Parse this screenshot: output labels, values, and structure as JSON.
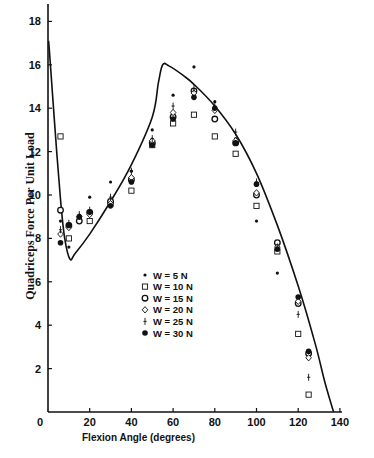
{
  "chart_data": {
    "type": "scatter",
    "title": "",
    "xlabel": "Flexion Angle (degrees)",
    "ylabel": "Quadriceps Force Per Unit Load",
    "xlim": [
      0,
      140
    ],
    "ylim": [
      0,
      18.8
    ],
    "xticks": [
      0,
      20,
      40,
      60,
      80,
      100,
      120,
      140
    ],
    "yticks": [
      0,
      2,
      4,
      6,
      8,
      10,
      12,
      14,
      16,
      18
    ],
    "grid": false,
    "legend_position": "center-left inside",
    "curve": {
      "name": "theoretical",
      "points": [
        [
          0.3,
          17.1
        ],
        [
          1,
          16.2
        ],
        [
          3,
          13.5
        ],
        [
          6,
          9.8
        ],
        [
          8,
          8.0
        ],
        [
          10.5,
          7.05
        ],
        [
          13,
          7.3
        ],
        [
          20,
          8.2
        ],
        [
          30,
          9.7
        ],
        [
          40,
          11.4
        ],
        [
          50,
          13.6
        ],
        [
          53,
          15.2
        ],
        [
          55,
          16.0
        ],
        [
          58,
          15.95
        ],
        [
          65,
          15.5
        ],
        [
          70,
          15.1
        ],
        [
          80,
          14.1
        ],
        [
          90,
          12.8
        ],
        [
          100,
          11.0
        ],
        [
          110,
          8.6
        ],
        [
          120,
          5.8
        ],
        [
          128,
          3.2
        ],
        [
          133,
          1.3
        ],
        [
          137,
          0
        ]
      ]
    },
    "series": [
      {
        "name": "W = 5 N",
        "marker": "small-dot",
        "points": [
          [
            6,
            8.8
          ],
          [
            10,
            7.6
          ],
          [
            20,
            9.9
          ],
          [
            30,
            10.6
          ],
          [
            40,
            11.1
          ],
          [
            50,
            13.0
          ],
          [
            60,
            14.6
          ],
          [
            70,
            15.9
          ],
          [
            80,
            14.3
          ],
          [
            90,
            12.6
          ],
          [
            100,
            8.8
          ],
          [
            110,
            6.4
          ],
          [
            120,
            5.3
          ],
          [
            125,
            2.6
          ]
        ]
      },
      {
        "name": "W = 10 N",
        "marker": "open-square",
        "points": [
          [
            6,
            12.7
          ],
          [
            10,
            8.0
          ],
          [
            20,
            8.8
          ],
          [
            30,
            9.6
          ],
          [
            40,
            10.2
          ],
          [
            50,
            12.3
          ],
          [
            60,
            13.3
          ],
          [
            70,
            13.7
          ],
          [
            80,
            12.7
          ],
          [
            90,
            11.9
          ],
          [
            100,
            9.5
          ],
          [
            110,
            7.4
          ],
          [
            120,
            3.6
          ],
          [
            125,
            0.8
          ]
        ]
      },
      {
        "name": "W = 15 N",
        "marker": "open-circle",
        "points": [
          [
            6,
            9.3
          ],
          [
            10,
            8.6
          ],
          [
            15,
            8.8
          ],
          [
            20,
            9.2
          ],
          [
            30,
            9.7
          ],
          [
            40,
            10.7
          ],
          [
            50,
            12.4
          ],
          [
            60,
            13.6
          ],
          [
            70,
            14.8
          ],
          [
            80,
            13.5
          ],
          [
            90,
            12.4
          ],
          [
            100,
            10.0
          ],
          [
            110,
            7.8
          ],
          [
            120,
            5.0
          ],
          [
            125,
            2.7
          ]
        ]
      },
      {
        "name": "W = 20 N",
        "marker": "open-diamond",
        "points": [
          [
            6,
            8.2
          ],
          [
            10,
            8.5
          ],
          [
            15,
            9.0
          ],
          [
            20,
            9.1
          ],
          [
            30,
            9.6
          ],
          [
            40,
            10.8
          ],
          [
            50,
            12.5
          ],
          [
            60,
            13.8
          ],
          [
            70,
            14.7
          ],
          [
            80,
            13.9
          ],
          [
            90,
            12.5
          ],
          [
            100,
            10.1
          ],
          [
            110,
            7.6
          ],
          [
            120,
            5.1
          ],
          [
            125,
            2.5
          ]
        ]
      },
      {
        "name": "W = 25 N",
        "marker": "plus",
        "points": [
          [
            6,
            8.4
          ],
          [
            10,
            8.7
          ],
          [
            15,
            9.1
          ],
          [
            20,
            9.3
          ],
          [
            30,
            9.9
          ],
          [
            40,
            11.1
          ],
          [
            50,
            12.6
          ],
          [
            60,
            14.1
          ],
          [
            70,
            14.9
          ],
          [
            80,
            14.1
          ],
          [
            90,
            12.9
          ],
          [
            100,
            10.6
          ],
          [
            110,
            7.6
          ],
          [
            120,
            4.5
          ],
          [
            125,
            1.6
          ]
        ]
      },
      {
        "name": "W = 30 N",
        "marker": "filled-circle",
        "points": [
          [
            6,
            7.8
          ],
          [
            10,
            8.6
          ],
          [
            15,
            9.0
          ],
          [
            20,
            9.2
          ],
          [
            30,
            9.5
          ],
          [
            40,
            10.6
          ],
          [
            50,
            12.3
          ],
          [
            60,
            13.5
          ],
          [
            70,
            14.5
          ],
          [
            80,
            14.0
          ],
          [
            90,
            12.4
          ],
          [
            100,
            10.5
          ],
          [
            110,
            7.5
          ],
          [
            120,
            5.3
          ],
          [
            125,
            2.8
          ]
        ]
      }
    ]
  },
  "legend": {
    "items": [
      {
        "label": "W =   5 N",
        "marker": "small-dot"
      },
      {
        "label": "W = 10 N",
        "marker": "open-square"
      },
      {
        "label": "W = 15 N",
        "marker": "open-circle"
      },
      {
        "label": "W = 20 N",
        "marker": "open-diamond"
      },
      {
        "label": "W = 25 N",
        "marker": "plus"
      },
      {
        "label": "W = 30 N",
        "marker": "filled-circle"
      }
    ]
  },
  "axes": {
    "x_title": "Flexion Angle  (degrees)",
    "y_title": "Quadriceps Force Per Unit Load"
  }
}
